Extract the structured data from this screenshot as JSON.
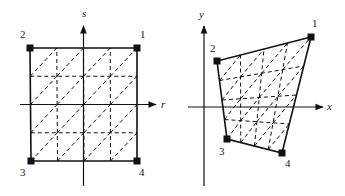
{
  "left_diagram": {
    "title": "parent element (r,s)",
    "axes": {
      "horizontal": "r",
      "vertical": "s"
    },
    "nodes": [
      {
        "id": "1",
        "label": "1",
        "x": 137,
        "y": 48,
        "lx": 140,
        "ly": 38
      },
      {
        "id": "2",
        "label": "2",
        "x": 30,
        "y": 48,
        "lx": 20,
        "ly": 38
      },
      {
        "id": "3",
        "label": "3",
        "x": 31,
        "y": 161,
        "lx": 20,
        "ly": 176
      },
      {
        "id": "4",
        "label": "4",
        "x": 137,
        "y": 161,
        "lx": 139,
        "ly": 176
      }
    ],
    "divisions": 4
  },
  "right_diagram": {
    "title": "mapped element (x,y)",
    "axes": {
      "horizontal": "x",
      "vertical": "y"
    },
    "nodes": [
      {
        "id": "1",
        "label": "1",
        "x": 311,
        "y": 37,
        "lx": 312,
        "ly": 27
      },
      {
        "id": "2",
        "label": "2",
        "x": 217,
        "y": 61,
        "lx": 210,
        "ly": 52
      },
      {
        "id": "3",
        "label": "3",
        "x": 227,
        "y": 139,
        "lx": 219,
        "ly": 155
      },
      {
        "id": "4",
        "label": "4",
        "x": 282,
        "y": 153,
        "lx": 285,
        "ly": 167
      }
    ],
    "divisions": 4
  },
  "colors": {
    "stroke": "#111111",
    "label": "#222222",
    "background": "#ffffff"
  }
}
